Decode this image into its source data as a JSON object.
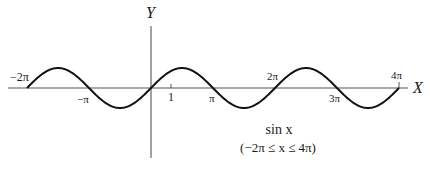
{
  "chart_data": {
    "type": "line",
    "title": "sin x",
    "subtitle": "(−2π ≤ x ≤ 4π)",
    "xlabel": "X",
    "ylabel": "Y",
    "xlim": [
      -6.2832,
      12.5664
    ],
    "ylim": [
      -1,
      1
    ],
    "grid": false,
    "legend": null,
    "function": "sin(x)",
    "x_tick_labels": [
      {
        "label": "−2π",
        "value": -6.2832,
        "position": "above"
      },
      {
        "label": "−π",
        "value": -3.1416,
        "position": "below"
      },
      {
        "label": "1",
        "value": 1,
        "position": "below"
      },
      {
        "label": "π",
        "value": 3.1416,
        "position": "below"
      },
      {
        "label": "2π",
        "value": 6.2832,
        "position": "above"
      },
      {
        "label": "3π",
        "value": 9.4248,
        "position": "below"
      },
      {
        "label": "4π",
        "value": 12.5664,
        "position": "above"
      }
    ],
    "series": [
      {
        "name": "sin x",
        "x": [
          -6.2832,
          -4.7124,
          -3.1416,
          -1.5708,
          0,
          1.5708,
          3.1416,
          4.7124,
          6.2832,
          7.854,
          9.4248,
          10.9956,
          12.5664
        ],
        "values": [
          0,
          1,
          0,
          -1,
          0,
          1,
          0,
          -1,
          0,
          1,
          0,
          -1,
          0
        ]
      }
    ]
  },
  "labels": {
    "y_axis": "Y",
    "x_axis": "X",
    "tick_neg2pi": "−2π",
    "tick_negpi": "−π",
    "tick_one": "1",
    "tick_pi": "π",
    "tick_2pi": "2π",
    "tick_3pi": "3π",
    "tick_4pi": "4π",
    "caption_func": "sin x",
    "caption_range": "(−2π ≤ x ≤ 4π)"
  },
  "colors": {
    "curve": "#111111",
    "axis": "#555555",
    "background": "#ffffff"
  }
}
